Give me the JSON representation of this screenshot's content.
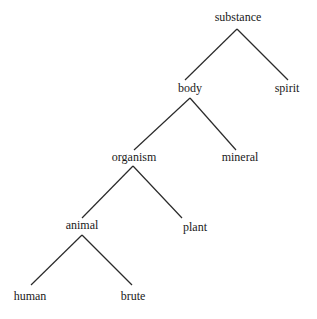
{
  "diagram": {
    "type": "tree",
    "nodes": [
      {
        "id": "substance",
        "label": "substance",
        "x": 238,
        "y": 17
      },
      {
        "id": "body",
        "label": "body",
        "x": 190,
        "y": 87
      },
      {
        "id": "spirit",
        "label": "spirit",
        "x": 287,
        "y": 87
      },
      {
        "id": "organism",
        "label": "organism",
        "x": 134,
        "y": 157
      },
      {
        "id": "mineral",
        "label": "mineral",
        "x": 240,
        "y": 157
      },
      {
        "id": "animal",
        "label": "animal",
        "x": 82,
        "y": 226
      },
      {
        "id": "plant",
        "label": "plant",
        "x": 195,
        "y": 226
      },
      {
        "id": "human",
        "label": "human",
        "x": 30,
        "y": 296
      },
      {
        "id": "brute",
        "label": "brute",
        "x": 133,
        "y": 296
      }
    ],
    "edges": [
      {
        "from": "substance",
        "to": "body",
        "x1": 237,
        "y1": 29,
        "x2": 185,
        "y2": 80
      },
      {
        "from": "substance",
        "to": "spirit",
        "x1": 237,
        "y1": 29,
        "x2": 288,
        "y2": 80
      },
      {
        "from": "body",
        "to": "organism",
        "x1": 190,
        "y1": 98,
        "x2": 134,
        "y2": 150
      },
      {
        "from": "body",
        "to": "mineral",
        "x1": 190,
        "y1": 98,
        "x2": 236,
        "y2": 150
      },
      {
        "from": "organism",
        "to": "animal",
        "x1": 133,
        "y1": 166,
        "x2": 82,
        "y2": 218
      },
      {
        "from": "organism",
        "to": "plant",
        "x1": 133,
        "y1": 166,
        "x2": 182,
        "y2": 218
      },
      {
        "from": "animal",
        "to": "human",
        "x1": 82,
        "y1": 235,
        "x2": 31,
        "y2": 285
      },
      {
        "from": "animal",
        "to": "brute",
        "x1": 82,
        "y1": 235,
        "x2": 132,
        "y2": 285
      }
    ]
  }
}
